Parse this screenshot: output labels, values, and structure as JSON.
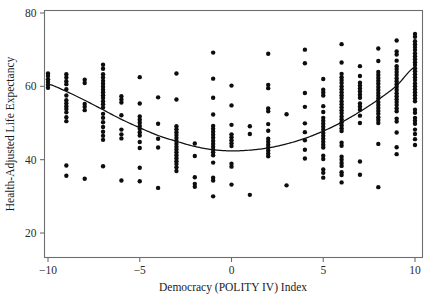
{
  "chart_data": {
    "type": "scatter",
    "title": "",
    "subtitle": "",
    "xlabel": "Democracy (POLITY IV) Index",
    "ylabel": "Health-Adjusted Life Expectancy",
    "xlim": [
      -11,
      11
    ],
    "ylim": [
      18,
      82
    ],
    "xticks": [
      -10,
      -5,
      0,
      5,
      10
    ],
    "xtick_labels": [
      "−10",
      "−5",
      "0",
      "5",
      "10"
    ],
    "yticks": [
      20,
      40,
      60,
      80
    ],
    "ytick_labels": [
      "20",
      "40",
      "60",
      "80"
    ],
    "grid": false,
    "legend": null,
    "legend_position": "none",
    "marker": "filled-circle",
    "marker_color": "#0d0d0d",
    "marker_radius": 2.2,
    "frame_color": "#6e6e6e",
    "curve_color": "#111111",
    "annotations": [],
    "series": [
      {
        "name": "Countries",
        "x": [
          -10,
          -10,
          -10,
          -10,
          -10,
          -10,
          -9,
          -9,
          -9,
          -9,
          -9,
          -9,
          -9,
          -9,
          -9,
          -9,
          -9,
          -9,
          -9,
          -9,
          -9,
          -8,
          -8,
          -8,
          -8,
          -8,
          -8,
          -7,
          -7,
          -7,
          -7,
          -7,
          -7,
          -7,
          -7,
          -7,
          -7,
          -7,
          -7,
          -7,
          -7,
          -7,
          -7,
          -7,
          -7,
          -7,
          -7,
          -7,
          -7,
          -6,
          -6,
          -6,
          -6,
          -6,
          -6,
          -6,
          -6,
          -5,
          -5,
          -5,
          -5,
          -5,
          -5,
          -5,
          -5,
          -5,
          -5,
          -5,
          -5,
          -5,
          -4,
          -4,
          -4,
          -4,
          -4,
          -3,
          -3,
          -3,
          -3,
          -3,
          -3,
          -3,
          -3,
          -3,
          -3,
          -3,
          -3,
          -3,
          -3,
          -3,
          -3,
          -3,
          -3,
          -2,
          -2,
          -2,
          -2,
          -2,
          -1,
          -1,
          -1,
          -1,
          -1,
          -1,
          -1,
          -1,
          -1,
          -1,
          -1,
          -1,
          -1,
          -1,
          -1,
          -1,
          -1,
          -1,
          -1,
          0,
          0,
          0,
          0,
          0,
          0,
          0,
          0,
          0,
          0,
          0,
          1,
          1,
          1,
          2,
          2,
          2,
          2,
          2,
          2,
          2,
          2,
          2,
          2,
          2,
          2,
          2,
          2,
          3,
          3,
          4,
          4,
          4,
          4,
          4,
          4,
          4,
          4,
          4,
          5,
          5,
          5,
          5,
          5,
          5,
          5,
          5,
          5,
          5,
          5,
          5,
          5,
          5,
          5,
          5,
          5,
          5,
          5,
          5,
          5,
          5,
          6,
          6,
          6,
          6,
          6,
          6,
          6,
          6,
          6,
          6,
          6,
          6,
          6,
          6,
          6,
          6,
          6,
          6,
          6,
          6,
          6,
          6,
          6,
          6,
          6,
          6,
          6,
          6,
          6,
          6,
          6,
          7,
          7,
          7,
          7,
          7,
          7,
          7,
          7,
          7,
          7,
          7,
          7,
          7,
          7,
          7,
          8,
          8,
          8,
          8,
          8,
          8,
          8,
          8,
          8,
          8,
          8,
          8,
          8,
          8,
          8,
          8,
          8,
          8,
          8,
          8,
          8,
          8,
          9,
          9,
          9,
          9,
          9,
          9,
          9,
          9,
          9,
          9,
          9,
          9,
          9,
          9,
          9,
          9,
          9,
          9,
          9,
          9,
          9,
          9,
          9,
          9,
          9,
          10,
          10,
          10,
          10,
          10,
          10,
          10,
          10,
          10,
          10,
          10,
          10,
          10,
          10,
          10,
          10,
          10,
          10,
          10,
          10,
          10,
          10,
          10,
          10,
          10,
          10,
          10,
          10,
          10,
          10,
          10,
          10
        ],
        "y": [
          63.5,
          62.8,
          61.9,
          61.2,
          60.4,
          59.6,
          63.3,
          62.4,
          61.4,
          60.6,
          59.2,
          57.5,
          56.2,
          55.4,
          54.6,
          53.8,
          52.9,
          51.6,
          50.5,
          38.4,
          35.6,
          34.8,
          61.8,
          60.9,
          55.2,
          54.4,
          53.5,
          65.9,
          64.8,
          63.3,
          62.4,
          61.5,
          60.7,
          59.9,
          59.1,
          58.4,
          57.6,
          56.8,
          55.9,
          55.1,
          54.2,
          52.5,
          51.4,
          50.2,
          48.9,
          47.6,
          46.5,
          45.4,
          38.2,
          34.3,
          57.3,
          56.4,
          55.6,
          52.1,
          48.2,
          46.9,
          45.8,
          62.5,
          55.3,
          51.8,
          50.9,
          50.1,
          49.2,
          48.4,
          47.5,
          46.6,
          44.8,
          43.2,
          37.8,
          34.1,
          32.3,
          57.0,
          49.8,
          45.7,
          43.3,
          63.5,
          56.4,
          49.1,
          48.3,
          47.5,
          46.7,
          45.9,
          45.1,
          44.3,
          43.5,
          42.8,
          42.0,
          41.2,
          40.4,
          39.6,
          38.8,
          37.9,
          36.9,
          35.2,
          33.4,
          32.6,
          44.4,
          41.0,
          69.2,
          62.1,
          56.9,
          52.3,
          49.2,
          48.4,
          47.6,
          46.8,
          46.0,
          45.1,
          44.3,
          43.5,
          42.7,
          42.0,
          41.2,
          39.2,
          35.1,
          34.3,
          30.0,
          60.2,
          54.8,
          49.5,
          46.9,
          46.1,
          45.3,
          44.5,
          43.7,
          38.9,
          38.1,
          33.2,
          49.1,
          47.0,
          30.4,
          68.9,
          60.4,
          59.5,
          54.0,
          53.2,
          49.7,
          47.9,
          45.7,
          44.9,
          44.1,
          43.3,
          42.5,
          41.7,
          40.9,
          52.4,
          33.0,
          70.0,
          66.3,
          58.2,
          54.4,
          49.9,
          47.5,
          45.3,
          42.7,
          40.3,
          62.0,
          59.1,
          58.3,
          57.5,
          54.6,
          53.0,
          51.4,
          50.6,
          49.8,
          49.0,
          48.2,
          47.3,
          46.5,
          45.7,
          44.9,
          44.1,
          43.3,
          41.1,
          40.2,
          37.3,
          36.4,
          35.1,
          71.5,
          66.5,
          63.4,
          62.5,
          61.7,
          60.9,
          60.0,
          59.2,
          58.4,
          57.6,
          56.8,
          55.9,
          55.1,
          54.3,
          53.5,
          52.7,
          51.8,
          51.0,
          50.2,
          49.4,
          48.6,
          47.8,
          44.6,
          43.8,
          40.8,
          40.0,
          39.1,
          38.3,
          36.6,
          35.8,
          33.8,
          65.5,
          62.8,
          61.0,
          60.2,
          59.4,
          58.6,
          57.7,
          56.9,
          55.3,
          54.5,
          53.6,
          52.0,
          50.0,
          39.5,
          35.9,
          70.3,
          66.9,
          63.9,
          63.1,
          62.3,
          61.5,
          60.7,
          59.8,
          59.0,
          58.2,
          57.4,
          56.6,
          55.7,
          54.9,
          54.1,
          53.3,
          52.5,
          51.6,
          50.8,
          50.0,
          44.3,
          32.5,
          72.5,
          69.5,
          68.7,
          67.0,
          65.5,
          64.7,
          63.9,
          63.1,
          62.2,
          61.4,
          60.6,
          59.8,
          59.0,
          58.1,
          57.3,
          56.5,
          55.7,
          54.9,
          54.0,
          53.2,
          51.2,
          50.4,
          47.4,
          43.4,
          41.5,
          74.3,
          73.5,
          72.3,
          71.5,
          70.7,
          69.9,
          69.0,
          68.2,
          67.4,
          66.6,
          65.8,
          64.9,
          64.1,
          63.3,
          62.5,
          61.7,
          60.8,
          60.0,
          59.2,
          58.4,
          57.6,
          56.7,
          55.9,
          53.6,
          52.8,
          51.4,
          50.6,
          49.8,
          48.2,
          47.0,
          45.6,
          44.0
        ]
      }
    ],
    "fit_curve": {
      "name": "Quadratic fit",
      "type": "quadratic",
      "x": [
        -10,
        -9,
        -8,
        -7,
        -6,
        -5,
        -4,
        -3,
        -2,
        -1,
        0,
        1,
        2,
        3,
        4,
        5,
        6,
        7,
        8,
        9,
        10
      ],
      "y": [
        60.6,
        58.6,
        56.2,
        53.6,
        51.0,
        48.7,
        46.6,
        45.0,
        43.6,
        42.7,
        42.4,
        42.6,
        43.2,
        44.3,
        45.8,
        47.8,
        50.2,
        53.1,
        56.4,
        60.2,
        65.3
      ],
      "vertex_x": 0.2,
      "vertex_y": 42.4
    }
  }
}
